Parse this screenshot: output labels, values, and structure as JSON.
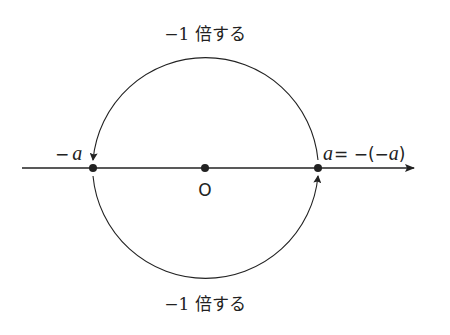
{
  "diagram": {
    "top_label": "−1 倍する",
    "bottom_label": "−1 倍する",
    "points": [
      {
        "id": "neg-a",
        "label": "−a"
      },
      {
        "id": "origin",
        "label": "O"
      },
      {
        "id": "a",
        "label": "a = −(−a)"
      }
    ],
    "label_neg_sign": "−",
    "label_a": "a",
    "label_eq": "= −(−",
    "label_close": ")",
    "origin_label": "O",
    "colors": {
      "line": "#222222",
      "background": "#ffffff"
    }
  }
}
